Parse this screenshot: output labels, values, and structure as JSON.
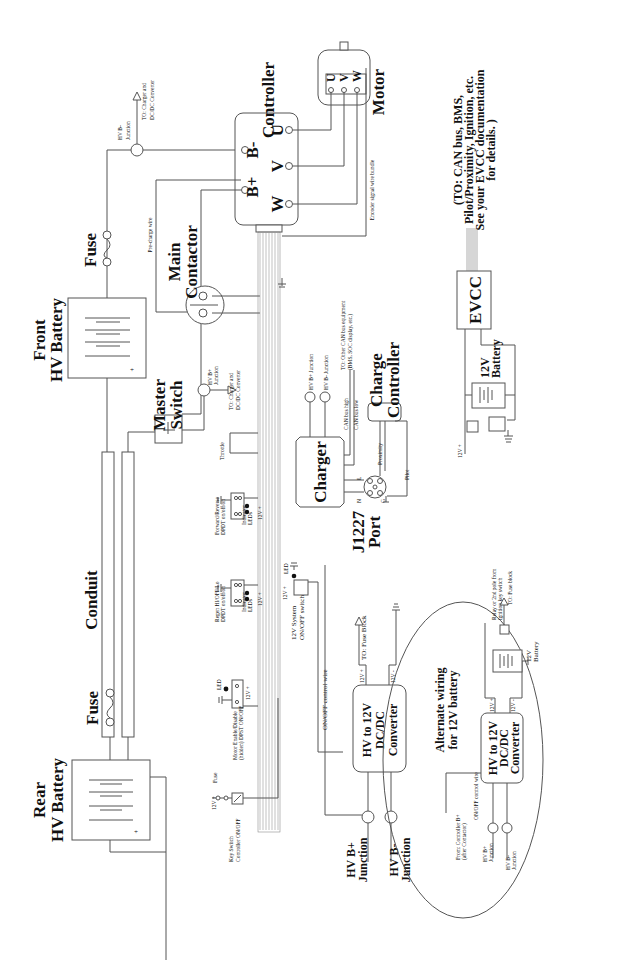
{
  "diagram": {
    "orientation": "rotated-90-ccw",
    "components": {
      "front_battery": {
        "label_1": "Front",
        "label_2": "HV Battery",
        "plus": "+",
        "minus": "—"
      },
      "rear_battery": {
        "label_1": "Rear",
        "label_2": "HV Battery",
        "plus": "+",
        "minus": "—"
      },
      "fuse_front": {
        "label": "Fuse"
      },
      "fuse_rear": {
        "label": "Fuse"
      },
      "conduit": {
        "label": "Conduit"
      },
      "master_switch": {
        "label_1": "Master",
        "label_2": "Switch"
      },
      "main_contactor": {
        "label_1": "Main",
        "label_2": "Contactor"
      },
      "pre_charge": {
        "label": "Pre-charge wire"
      },
      "controller": {
        "label": "Controller",
        "terminals": [
          "B-",
          "U",
          "B+",
          "V",
          "W"
        ]
      },
      "motor": {
        "label": "Motor",
        "terminals": [
          "U",
          "V",
          "W"
        ]
      },
      "encoder": {
        "label": "Encoder signal wire bundle"
      },
      "hv_bminus_top": {
        "label_1": "HV B-",
        "label_2": "Junction",
        "to_1": "TO: Charger and",
        "to_2": "DC/DC Converter"
      },
      "hv_bplus_mid": {
        "label_1": "HV B+",
        "label_2": "Junction",
        "to_1": "TO: Charger and",
        "to_2": "DC/DC Converter"
      },
      "throttle": {
        "label": "Throttle"
      },
      "fwd_rev": {
        "label_1": "Forward/Reverse",
        "label_2": "DPDT on/off/on",
        "led_1": "Indicator",
        "led_2": "LEDs",
        "v": "12V +"
      },
      "regen": {
        "label_1": "Regen HI/OFF/Lo",
        "label_2": "DPDT on/off/on",
        "led_1": "Indicator",
        "led_2": "LEDs",
        "v": "12V +"
      },
      "motor_enable": {
        "label_1": "Motor Enable/Disable",
        "label_2": "(hidden) DPST ON/OFF",
        "led": "LED",
        "v": "12V +"
      },
      "key_switch": {
        "label_1": "Key Switch",
        "label_2": "Controller ON/OFF",
        "fuse": "Fuse",
        "v": "12V +"
      },
      "charger": {
        "label": "Charger",
        "hv_bplus": "HV B+ Junction",
        "hv_bminus": "HV B- Junction",
        "can_high": "CAN bus high",
        "can_low": "CAN bus low",
        "to_1": "TO: Other CAN bus equipment",
        "to_2": "(BMS, SOC display, etc.)"
      },
      "charge_controller": {
        "label_1": "Charge",
        "label_2": "Controller"
      },
      "j1227": {
        "label_1": "J1227",
        "label_2": "Port",
        "proximity": "Proximity",
        "pilot": "Pilot",
        "pins": [
          "L",
          "N",
          "G"
        ]
      },
      "sys_switch": {
        "label_1": "12V System",
        "label_2": "ON/OFF switch",
        "led": "LED",
        "v": "12V +"
      },
      "dcdc": {
        "label_1": "HV to 12V",
        "label_2": "DC/DC",
        "label_3": "Converter",
        "out_plus": "12V +",
        "out_minus": "12V -",
        "to": "TO: Fuse Block",
        "control": "ON/OFF control wire",
        "hv_bplus_1": "HV B+",
        "hv_bplus_2": "Junction",
        "hv_bminus_1": "HV B-",
        "hv_bminus_2": "Junction"
      },
      "evcc": {
        "label": "EVCC",
        "note_1": "(TO: CAN bus, BMS,",
        "note_2": "Pilot/Proximity, Ignition, etc.",
        "note_3": "See your EVCC documentation",
        "note_4": "for details. )",
        "battery_1": "12V",
        "battery_2": "Battery",
        "v": "12V +"
      },
      "alternate": {
        "title_1": "Alternate wiring",
        "title_2": "for 12V battery",
        "from_1": "From: Controller B+",
        "from_2": "(after Contactor)",
        "control": "ON/OFF control wire",
        "dcdc_1": "HV to 12V",
        "dcdc_2": "DC/DC",
        "dcdc_3": "Converter",
        "out_plus": "12V +",
        "out_minus": "12V -",
        "battery_1": "12V",
        "battery_2": "Battery",
        "relay_1": "Relay or 2nd pole from",
        "relay_2": "ignition key switch",
        "to": "TO: Fuse block",
        "hv_bplus_1": "HV B+",
        "hv_bplus_2": "Junction",
        "hv_bminus_1": "HV B-",
        "hv_bminus_2": "Junction"
      }
    }
  }
}
